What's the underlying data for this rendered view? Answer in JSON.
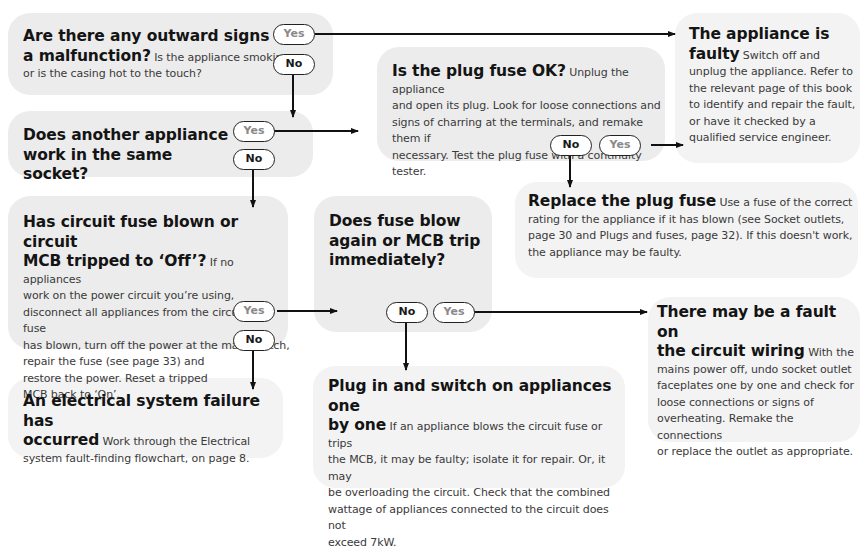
{
  "nodes": {
    "q1": {
      "title": "Are there any outward signs of a malfunction?",
      "title_line1": "Are there any outward signs of",
      "title_line2": "a malfunction?",
      "body": "Is the appliance smoking or is the casing hot to the touch?",
      "body_line1": " Is the appliance smoking",
      "body_line2": "or is the casing hot to the touch?",
      "yes": "Yes",
      "no": "No"
    },
    "q2": {
      "title_line1": "Does another appliance",
      "title_line2": "work in the same socket?",
      "yes": "Yes",
      "no": "No"
    },
    "q3": {
      "title": "Is the plug fuse OK?",
      "body_line1": " Unplug the appliance",
      "body_line2": "and open its plug. Look for loose connections and",
      "body_line3": "signs of charring at the terminals, and remake them if",
      "body_line4": "necessary. Test the plug fuse with a continuity tester.",
      "no": "No",
      "yes": "Yes"
    },
    "faulty": {
      "title_line1": "The appliance is",
      "title_line2": "faulty",
      "body_line1": " Switch off and",
      "body_line2": "unplug the appliance. Refer to",
      "body_line3": "the relevant page of this book",
      "body_line4": "to identify and repair the fault,",
      "body_line5": "or have it checked by a",
      "body_line6": "qualified service engineer."
    },
    "replace": {
      "title": "Replace the plug fuse",
      "body_line1": " Use a fuse of the correct",
      "body_line2": "rating for the appliance if it has blown (see Socket outlets,",
      "body_line3": "page 30 and Plugs and fuses, page 32). If this doesn't work,",
      "body_line4": "the appliance may be faulty."
    },
    "q4": {
      "title_line1": "Has circuit fuse blown or circuit",
      "title_line2": "MCB tripped to ‘Off’?",
      "body_line1": " If no appliances",
      "body_line2": "work on the power circuit you’re using,",
      "body_line3": "disconnect all appliances from the circuit. If a fuse",
      "body_line4": "has blown, turn off the power at the main switch,",
      "body_line5": "repair the fuse (see page 33) and",
      "body_line6": "restore the power. Reset a tripped",
      "body_line7": "MCB back to ‘On’.",
      "yes": "Yes",
      "no": "No"
    },
    "q5": {
      "title_line1": "Does fuse blow",
      "title_line2": "again or MCB trip",
      "title_line3": "immediately?",
      "no": "No",
      "yes": "Yes"
    },
    "system_failure": {
      "title_line1": "An electrical system failure has",
      "title_line2": "occurred",
      "body_line1": " Work through the Electrical",
      "body_line2": "system fault-finding flowchart, on page 8."
    },
    "one_by_one": {
      "title_line1": "Plug in and switch on appliances one",
      "title_line2": "by one",
      "body_line1": " If an appliance blows the circuit fuse or trips",
      "body_line2": "the MCB, it may be faulty; isolate it for repair. Or, it may",
      "body_line3": "be overloading the circuit. Check that the combined",
      "body_line4": "wattage of appliances connected to the circuit does not",
      "body_line5": "exceed 7kW."
    },
    "wiring": {
      "title_line1": "There may be a fault on",
      "title_line2": "the circuit wiring",
      "body_line1": " With the",
      "body_line2": "mains power off, undo socket outlet",
      "body_line3": "faceplates one by one and check for",
      "body_line4": "loose connections or signs of",
      "body_line5": "overheating. Remake the connections",
      "body_line6": "or replace the outlet as appropriate."
    }
  },
  "edges": [
    {
      "from": "q1",
      "answer": "Yes",
      "to": "faulty"
    },
    {
      "from": "q1",
      "answer": "No",
      "to": "q2"
    },
    {
      "from": "q2",
      "answer": "Yes",
      "to": "q3"
    },
    {
      "from": "q2",
      "answer": "No",
      "to": "q4"
    },
    {
      "from": "q3",
      "answer": "Yes",
      "to": "faulty"
    },
    {
      "from": "q3",
      "answer": "No",
      "to": "replace"
    },
    {
      "from": "q4",
      "answer": "Yes",
      "to": "q5"
    },
    {
      "from": "q4",
      "answer": "No",
      "to": "system_failure"
    },
    {
      "from": "q5",
      "answer": "Yes",
      "to": "wiring"
    },
    {
      "from": "q5",
      "answer": "No",
      "to": "one_by_one"
    }
  ],
  "colors": {
    "box_fill": "#ececec",
    "line": "#111111",
    "yes_text": "#8a8a8a",
    "no_text": "#1a1a1a"
  }
}
